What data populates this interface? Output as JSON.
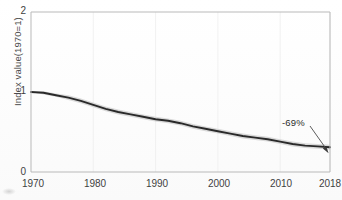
{
  "chart_data": {
    "type": "line",
    "title": "",
    "xlabel": "",
    "ylabel": "Index value(1970=1)",
    "xlim": [
      1970,
      2018
    ],
    "ylim": [
      0,
      2
    ],
    "grid": "faint-vertical",
    "legend": "none",
    "xticks": [
      "1970",
      "1980",
      "1990",
      "2000",
      "2010",
      "2018"
    ],
    "xtick_values": [
      1970,
      1980,
      1990,
      2000,
      2010,
      2018
    ],
    "yticks": [
      "0",
      "1",
      "2"
    ],
    "ytick_values": [
      0,
      1,
      2
    ],
    "series": [
      {
        "name": "Index value",
        "line_color": "#2a2a2a",
        "band_color": "#d2d2d2",
        "x": [
          1970,
          1972,
          1974,
          1976,
          1978,
          1980,
          1982,
          1984,
          1986,
          1988,
          1990,
          1992,
          1994,
          1996,
          1998,
          2000,
          2002,
          2004,
          2006,
          2008,
          2010,
          2012,
          2014,
          2016,
          2018
        ],
        "values": [
          1.0,
          0.99,
          0.96,
          0.93,
          0.89,
          0.84,
          0.79,
          0.75,
          0.72,
          0.69,
          0.66,
          0.64,
          0.61,
          0.57,
          0.54,
          0.51,
          0.48,
          0.45,
          0.43,
          0.41,
          0.38,
          0.35,
          0.33,
          0.32,
          0.31
        ],
        "band_low": [
          1.0,
          0.97,
          0.94,
          0.9,
          0.86,
          0.81,
          0.76,
          0.72,
          0.69,
          0.66,
          0.63,
          0.61,
          0.58,
          0.54,
          0.51,
          0.48,
          0.45,
          0.42,
          0.4,
          0.38,
          0.35,
          0.32,
          0.3,
          0.29,
          0.28
        ],
        "band_high": [
          1.0,
          1.01,
          0.98,
          0.96,
          0.92,
          0.87,
          0.82,
          0.78,
          0.75,
          0.72,
          0.69,
          0.67,
          0.64,
          0.6,
          0.57,
          0.54,
          0.51,
          0.48,
          0.46,
          0.44,
          0.41,
          0.38,
          0.36,
          0.35,
          0.34
        ]
      }
    ],
    "annotations": [
      {
        "text": "-69%",
        "points_to_x": 2018,
        "points_to_y": 0.31
      }
    ]
  },
  "axis": {
    "ylabel": "Index value(1970=1)",
    "ytick_0": "0",
    "ytick_1": "1",
    "ytick_2": "2",
    "xtick_1970": "1970",
    "xtick_1980": "1980",
    "xtick_1990": "1990",
    "xtick_2000": "2000",
    "xtick_2010": "2010",
    "xtick_2018": "2018"
  },
  "annotation": {
    "decline_label": "-69%"
  }
}
